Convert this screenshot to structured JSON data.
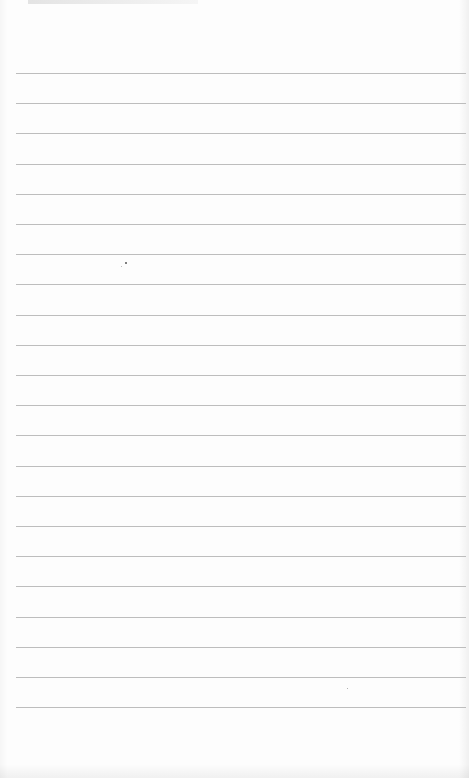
{
  "page": {
    "type": "blank lined paper",
    "background_color": "#fdfdfd",
    "line_color": "#bdbdbd",
    "line_count": 22,
    "first_line_y": 73,
    "line_spacing": 30.2,
    "line_left": 16,
    "line_width": 450,
    "text_content": ""
  }
}
